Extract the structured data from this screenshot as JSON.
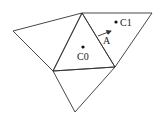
{
  "diagram": {
    "type": "triangle-mesh",
    "vertices": {
      "top": [
        82,
        13
      ],
      "right_top": [
        152,
        13
      ],
      "left": [
        13,
        31
      ],
      "mid_right": [
        115,
        67
      ],
      "lower_left": [
        53,
        71
      ],
      "bottom": [
        75,
        112
      ]
    },
    "triangles": [
      {
        "name": "T0",
        "points": "82,13 53,71 115,67"
      },
      {
        "name": "T1",
        "points": "82,13 152,13 115,67"
      },
      {
        "name": "T-left",
        "points": "82,13 13,31 53,71"
      },
      {
        "name": "T-bottom",
        "points": "53,71 115,67 75,112"
      }
    ],
    "points": [
      {
        "id": "c0",
        "label": "C0",
        "x": 83,
        "y": 47
      },
      {
        "id": "c1",
        "label": "C1",
        "x": 116,
        "y": 22
      }
    ],
    "arrow": {
      "label": "A",
      "x1": 98,
      "y1": 36,
      "x2": 111,
      "y2": 31
    },
    "stroke_color": "#333333"
  }
}
